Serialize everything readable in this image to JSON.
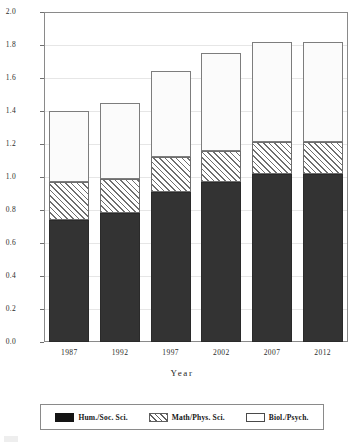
{
  "chart_data": {
    "type": "bar",
    "subtype": "stacked-bar",
    "title": "",
    "xlabel": "Year",
    "ylabel": "",
    "categories": [
      "1987",
      "1992",
      "1997",
      "2002",
      "2007",
      "2012"
    ],
    "series": [
      {
        "name": "Hum./Soc. Sci.",
        "values": [
          0.74,
          0.78,
          0.91,
          0.97,
          1.02,
          1.02
        ],
        "fill": "solid-black",
        "color": "#333333"
      },
      {
        "name": "Math/Phys. Sci.",
        "values": [
          0.23,
          0.21,
          0.21,
          0.19,
          0.19,
          0.19
        ],
        "fill": "diagonal-hatch",
        "color": "#6f6f6f"
      },
      {
        "name": "Biol./Psych.",
        "values": [
          0.43,
          0.46,
          0.52,
          0.59,
          0.61,
          0.61
        ],
        "fill": "white",
        "color": "#fbfbfb"
      }
    ],
    "totals": [
      1.4,
      1.45,
      1.64,
      1.75,
      1.82,
      1.82
    ],
    "ylim": [
      0.0,
      2.0
    ],
    "ytick_labels": [
      "0.0",
      "0.2",
      "0.4",
      "0.6",
      "0.8",
      "1.0",
      "1.2",
      "1.4",
      "1.6",
      "1.8",
      "2.0"
    ],
    "ytick_values": [
      0.0,
      0.2,
      0.4,
      0.6,
      0.8,
      1.0,
      1.2,
      1.4,
      1.6,
      1.8,
      2.0
    ],
    "grid": true,
    "legend_position": "bottom",
    "legend_entries": [
      "Hum./Soc. Sci.",
      "Math/Phys. Sci.",
      "Biol./Psych."
    ]
  },
  "axis": {
    "x_title": "Year"
  },
  "legend": {
    "items": [
      {
        "label": "Hum./Soc. Sci."
      },
      {
        "label": "Math/Phys. Sci."
      },
      {
        "label": "Biol./Psych."
      }
    ]
  }
}
